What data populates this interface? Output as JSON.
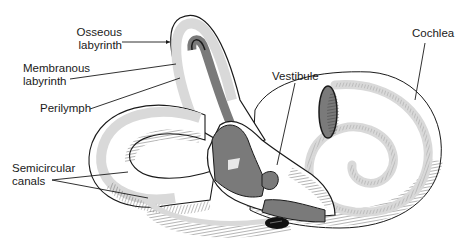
{
  "diagram": {
    "colors": {
      "background": "#ffffff",
      "outline": "#1a1a1a",
      "perilymph_fill": "#d9d9d9",
      "membranous_fill": "#7a7a7a",
      "hatching": "#2a2a2a"
    },
    "labels": [
      {
        "id": "osseous-labyrinth",
        "text": "Osseous\nlabyrinth"
      },
      {
        "id": "membranous-labyrinth",
        "text": "Membranous\nlabyrinth"
      },
      {
        "id": "perilymph",
        "text": "Perilymph"
      },
      {
        "id": "semicircular-canals",
        "text": "Semicircular\ncanals"
      },
      {
        "id": "vestibule",
        "text": "Vestibule"
      },
      {
        "id": "cochlea",
        "text": "Cochlea"
      }
    ]
  }
}
